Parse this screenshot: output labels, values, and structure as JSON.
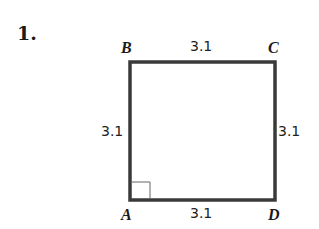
{
  "problem": {
    "number": "1."
  },
  "figure": {
    "shape": "square",
    "vertices": {
      "top_left": "B",
      "top_right": "C",
      "bottom_left": "A",
      "bottom_right": "D"
    },
    "sides": {
      "top": "3.1",
      "left": "3.1",
      "right": "3.1",
      "bottom": "3.1"
    },
    "right_angle_at": "A",
    "colors": {
      "stroke": "#3a3a3a",
      "text": "#1a1a1a",
      "background": "#ffffff"
    }
  }
}
